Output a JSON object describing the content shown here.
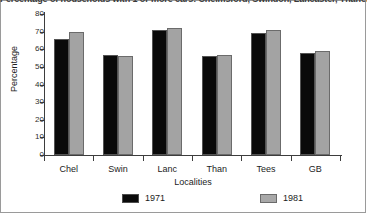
{
  "chart_data": {
    "type": "bar",
    "title": "Percentage of households with 1 or more cars: Chelmsford, Swindon, Lancaster, Thanet, Teesside and GB, 1971 and 1981",
    "xlabel": "Localities",
    "ylabel": "Percentage",
    "ylim": [
      0,
      80
    ],
    "yticks": [
      0,
      10,
      20,
      30,
      40,
      50,
      60,
      70,
      80
    ],
    "ytick_labels": [
      "0",
      "10",
      "20",
      "30",
      "40",
      "50",
      "60",
      "70",
      "80"
    ],
    "grid": false,
    "legend_position": "bottom",
    "categories": [
      "Chel",
      "Swin",
      "Lanc",
      "Than",
      "Tees",
      "GB"
    ],
    "series": [
      {
        "name": "1971",
        "color": "#0a0a0a",
        "values": [
          66,
          57,
          71,
          56,
          69,
          58
        ]
      },
      {
        "name": "1981",
        "color": "#a3a3a3",
        "values": [
          70,
          56,
          72,
          57,
          71,
          59
        ]
      }
    ]
  },
  "legend": {
    "items": [
      {
        "label": "1971"
      },
      {
        "label": "1981"
      }
    ]
  }
}
